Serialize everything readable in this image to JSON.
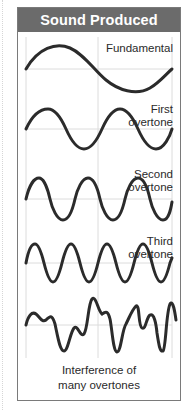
{
  "header": {
    "title": "Sound Produced"
  },
  "colors": {
    "header_bg": "#6b6b6b",
    "header_text": "#ffffff",
    "wave": "#2b2b2b",
    "grid": "#d9d9d9",
    "border": "#7a7a7a"
  },
  "waves": [
    {
      "id": "fundamental",
      "label_line1": "Fundamental",
      "label_line2": "",
      "cycles": 1
    },
    {
      "id": "first-overtone",
      "label_line1": "First",
      "label_line2": "overtone",
      "cycles": 2
    },
    {
      "id": "second-overtone",
      "label_line1": "Second",
      "label_line2": "overtone",
      "cycles": 3
    },
    {
      "id": "third-overtone",
      "label_line1": "Third",
      "label_line2": "overtone",
      "cycles": 4
    },
    {
      "id": "interference",
      "label_line1": "",
      "label_line2": "",
      "cycles": null
    }
  ],
  "caption": {
    "line1": "Interference of",
    "line2": "many overtones"
  }
}
